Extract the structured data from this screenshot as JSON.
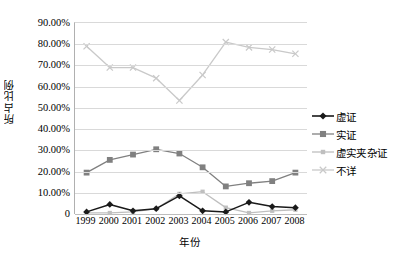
{
  "chart_data": {
    "type": "line",
    "title": "",
    "xlabel": "年份",
    "ylabel": "所占比例",
    "categories": [
      "1999",
      "2000",
      "2001",
      "2002",
      "2003",
      "2004",
      "2005",
      "2006",
      "2007",
      "2008"
    ],
    "ylim": [
      0,
      90
    ],
    "ytick_labels": [
      "0",
      "10.00%",
      "20.00%",
      "30.00%",
      "40.00%",
      "50.00%",
      "60.00%",
      "70.00%",
      "80.00%",
      "90.00%"
    ],
    "ytick_values": [
      0,
      10,
      20,
      30,
      40,
      50,
      60,
      70,
      80,
      90
    ],
    "grid": true,
    "legend_position": "right",
    "series": [
      {
        "name": "虚证",
        "marker": "diamond",
        "color": "#1a1a1a",
        "values": [
          1.0,
          4.5,
          1.5,
          2.5,
          8.5,
          1.5,
          1.0,
          5.5,
          3.5,
          3.0
        ]
      },
      {
        "name": "实证",
        "marker": "square",
        "color": "#808080",
        "values": [
          19.5,
          25.5,
          28.0,
          30.5,
          28.5,
          22.0,
          13.0,
          14.5,
          15.5,
          19.5
        ]
      },
      {
        "name": "虚实夹杂证",
        "marker": "small-square",
        "color": "#bfbfbf",
        "values": [
          0.5,
          0.5,
          1.0,
          2.5,
          9.5,
          10.5,
          3.0,
          0.5,
          1.5,
          2.0
        ]
      },
      {
        "name": "不详",
        "marker": "x",
        "color": "#c9c9c9",
        "values": [
          79.0,
          69.0,
          69.0,
          64.0,
          53.5,
          65.5,
          81.0,
          78.5,
          77.5,
          75.5
        ]
      }
    ]
  }
}
